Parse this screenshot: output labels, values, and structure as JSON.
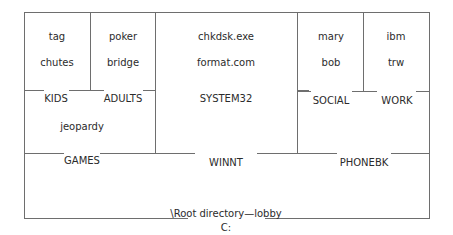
{
  "diagram": {
    "drive_label": "C:",
    "root_label": "\\Root directory—lobby",
    "folders": {
      "games": {
        "label": "GAMES",
        "subfolders": {
          "kids": {
            "label": "KIDS",
            "files": [
              "tag",
              "chutes"
            ]
          },
          "adults": {
            "label": "ADULTS",
            "files": [
              "poker",
              "bridge"
            ]
          }
        },
        "files": [
          "jeopardy"
        ]
      },
      "winnt": {
        "label": "WINNT",
        "subfolders": {
          "system32": {
            "label": "SYSTEM32",
            "files": [
              "chkdsk.exe",
              "format.com"
            ]
          }
        }
      },
      "phonebk": {
        "label": "PHONEBK",
        "subfolders": {
          "social": {
            "label": "SOCIAL",
            "files": [
              "mary",
              "bob"
            ]
          },
          "work": {
            "label": "WORK",
            "files": [
              "ibm",
              "trw"
            ]
          }
        }
      }
    }
  }
}
